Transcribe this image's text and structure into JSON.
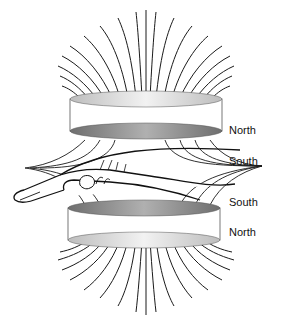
{
  "figure": {
    "labels": {
      "top_magnet_top": "North",
      "top_magnet_bottom": "South",
      "bottom_magnet_top": "South",
      "bottom_magnet_bottom": "North"
    },
    "colors": {
      "line": "#1a1a1a",
      "disc_light": "#e6e6e6",
      "disc_dark": "#8a8a8a",
      "background": "#ffffff"
    }
  }
}
